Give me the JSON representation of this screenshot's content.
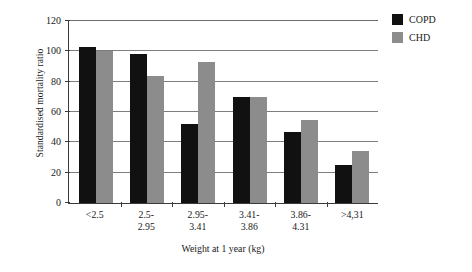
{
  "chart_data": {
    "type": "bar",
    "title": "",
    "xlabel": "Weight at 1 year (kg)",
    "ylabel": "Standardised mortality ratio",
    "categories": [
      "<2.5",
      "2.5-2.95",
      "2.95-3.41",
      "3.41-3.86",
      "3.86-4.31",
      ">4,31"
    ],
    "category_lines": [
      [
        "<2.5",
        ""
      ],
      [
        "2.5-",
        "2.95"
      ],
      [
        "2.95-",
        "3.41"
      ],
      [
        "3.41-",
        "3.86"
      ],
      [
        "3.86-",
        "4.31"
      ],
      [
        ">4,31",
        ""
      ]
    ],
    "series": [
      {
        "name": "COPD",
        "color": "#111111",
        "values": [
          103,
          98,
          52,
          70,
          47,
          25
        ]
      },
      {
        "name": "CHD",
        "color": "#8c8c8c",
        "values": [
          100,
          84,
          93,
          70,
          55,
          34
        ]
      }
    ],
    "ylim": [
      0,
      120
    ],
    "yticks": [
      0,
      20,
      40,
      60,
      80,
      100,
      120
    ],
    "ytick_labels": [
      "0",
      "20",
      "40",
      "60",
      "80",
      "100",
      "120"
    ],
    "grid": true,
    "grid_axis": "y",
    "legend_position": "right-top",
    "legend": [
      {
        "label": "COPD",
        "color": "#111111"
      },
      {
        "label": "CHD",
        "color": "#8c8c8c"
      }
    ]
  }
}
